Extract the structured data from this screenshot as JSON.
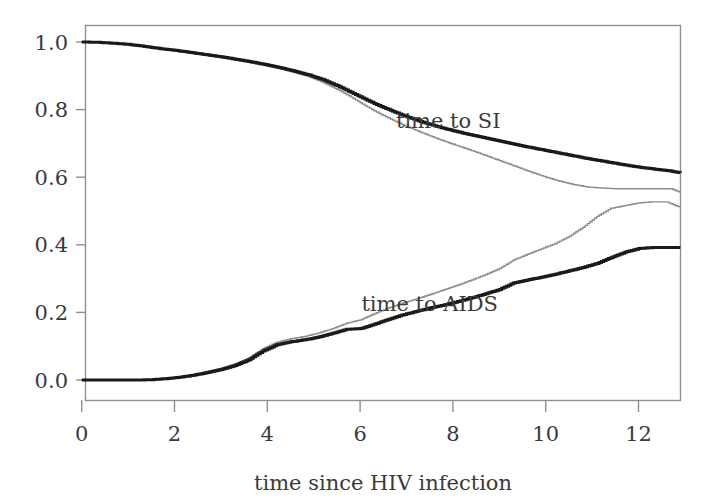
{
  "chart_data": {
    "type": "line",
    "title": "",
    "subtitle": "",
    "xlabel": "time since HIV infection",
    "ylabel": "",
    "xlim": [
      -0.1,
      12.92
    ],
    "ylim": [
      -0.02,
      1.055
    ],
    "grid": false,
    "legend_position": "inline-annotations",
    "x_ticks": [
      0,
      2,
      4,
      6,
      8,
      10,
      12
    ],
    "x_tick_labels": [
      "0",
      "2",
      "4",
      "6",
      "8",
      "10",
      "12"
    ],
    "y_ticks": [
      0.0,
      0.2,
      0.4,
      0.6,
      0.8,
      1.0
    ],
    "y_tick_labels": [
      "0.0",
      "0.2",
      "0.4",
      "0.6",
      "0.8",
      "1.0"
    ],
    "annotations": [
      {
        "text": "time to SI",
        "x": 7.9,
        "y": 0.745
      },
      {
        "text": "time to AIDS",
        "x": 7.5,
        "y": 0.205
      }
    ],
    "series": [
      {
        "name": "time to SI (bold)",
        "style": "step",
        "color": "#1a1a1a",
        "width": 3.0,
        "points": [
          [
            0.0,
            1.0
          ],
          [
            0.35,
            0.999
          ],
          [
            0.7,
            0.996
          ],
          [
            1.0,
            0.993
          ],
          [
            1.3,
            0.988
          ],
          [
            1.6,
            0.982
          ],
          [
            1.9,
            0.977
          ],
          [
            2.2,
            0.972
          ],
          [
            2.5,
            0.966
          ],
          [
            2.8,
            0.96
          ],
          [
            3.1,
            0.954
          ],
          [
            3.4,
            0.947
          ],
          [
            3.7,
            0.94
          ],
          [
            4.0,
            0.932
          ],
          [
            4.3,
            0.923
          ],
          [
            4.6,
            0.913
          ],
          [
            4.9,
            0.902
          ],
          [
            5.2,
            0.888
          ],
          [
            5.5,
            0.871
          ],
          [
            5.8,
            0.851
          ],
          [
            6.1,
            0.831
          ],
          [
            6.4,
            0.812
          ],
          [
            6.7,
            0.795
          ],
          [
            7.0,
            0.779
          ],
          [
            7.3,
            0.765
          ],
          [
            7.6,
            0.752
          ],
          [
            7.9,
            0.741
          ],
          [
            8.2,
            0.731
          ],
          [
            8.5,
            0.722
          ],
          [
            8.8,
            0.713
          ],
          [
            9.1,
            0.704
          ],
          [
            9.4,
            0.695
          ],
          [
            9.7,
            0.687
          ],
          [
            10.0,
            0.679
          ],
          [
            10.3,
            0.671
          ],
          [
            10.6,
            0.663
          ],
          [
            10.9,
            0.655
          ],
          [
            11.2,
            0.648
          ],
          [
            11.5,
            0.641
          ],
          [
            11.8,
            0.634
          ],
          [
            12.1,
            0.628
          ],
          [
            12.4,
            0.623
          ],
          [
            12.7,
            0.618
          ],
          [
            12.9,
            0.613
          ]
        ]
      },
      {
        "name": "time to SI (thin)",
        "style": "step",
        "color": "#8c8c8c",
        "width": 1.4,
        "points": [
          [
            0.0,
            1.0
          ],
          [
            0.35,
            0.999
          ],
          [
            0.7,
            0.996
          ],
          [
            1.0,
            0.992
          ],
          [
            1.3,
            0.987
          ],
          [
            1.6,
            0.981
          ],
          [
            1.9,
            0.976
          ],
          [
            2.2,
            0.97
          ],
          [
            2.5,
            0.964
          ],
          [
            2.8,
            0.958
          ],
          [
            3.1,
            0.952
          ],
          [
            3.4,
            0.945
          ],
          [
            3.7,
            0.937
          ],
          [
            4.0,
            0.929
          ],
          [
            4.3,
            0.92
          ],
          [
            4.6,
            0.909
          ],
          [
            4.9,
            0.897
          ],
          [
            5.2,
            0.88
          ],
          [
            5.5,
            0.86
          ],
          [
            5.8,
            0.837
          ],
          [
            6.1,
            0.812
          ],
          [
            6.4,
            0.789
          ],
          [
            6.7,
            0.769
          ],
          [
            7.0,
            0.75
          ],
          [
            7.3,
            0.733
          ],
          [
            7.6,
            0.717
          ],
          [
            7.9,
            0.702
          ],
          [
            8.2,
            0.688
          ],
          [
            8.5,
            0.674
          ],
          [
            8.8,
            0.659
          ],
          [
            9.1,
            0.644
          ],
          [
            9.4,
            0.629
          ],
          [
            9.7,
            0.614
          ],
          [
            10.0,
            0.6
          ],
          [
            10.3,
            0.588
          ],
          [
            10.6,
            0.578
          ],
          [
            10.9,
            0.571
          ],
          [
            11.2,
            0.568
          ],
          [
            11.5,
            0.566
          ],
          [
            11.8,
            0.566
          ],
          [
            12.1,
            0.566
          ],
          [
            12.4,
            0.566
          ],
          [
            12.7,
            0.566
          ],
          [
            12.9,
            0.555
          ]
        ]
      },
      {
        "name": "time to AIDS (bold)",
        "style": "step",
        "color": "#1a1a1a",
        "width": 3.0,
        "points": [
          [
            0.0,
            0.0
          ],
          [
            0.4,
            0.0
          ],
          [
            0.8,
            0.0
          ],
          [
            1.2,
            0.0
          ],
          [
            1.5,
            0.001
          ],
          [
            1.8,
            0.004
          ],
          [
            2.1,
            0.008
          ],
          [
            2.4,
            0.014
          ],
          [
            2.7,
            0.022
          ],
          [
            3.0,
            0.031
          ],
          [
            3.3,
            0.043
          ],
          [
            3.6,
            0.06
          ],
          [
            3.9,
            0.086
          ],
          [
            4.2,
            0.104
          ],
          [
            4.5,
            0.113
          ],
          [
            4.8,
            0.119
          ],
          [
            5.1,
            0.127
          ],
          [
            5.4,
            0.138
          ],
          [
            5.7,
            0.15
          ],
          [
            6.0,
            0.152
          ],
          [
            6.3,
            0.165
          ],
          [
            6.6,
            0.179
          ],
          [
            6.9,
            0.192
          ],
          [
            7.2,
            0.203
          ],
          [
            7.5,
            0.213
          ],
          [
            7.8,
            0.222
          ],
          [
            8.1,
            0.232
          ],
          [
            8.4,
            0.243
          ],
          [
            8.7,
            0.255
          ],
          [
            9.0,
            0.268
          ],
          [
            9.3,
            0.287
          ],
          [
            9.6,
            0.296
          ],
          [
            9.9,
            0.304
          ],
          [
            10.2,
            0.313
          ],
          [
            10.5,
            0.323
          ],
          [
            10.8,
            0.333
          ],
          [
            11.1,
            0.345
          ],
          [
            11.4,
            0.362
          ],
          [
            11.7,
            0.378
          ],
          [
            12.0,
            0.389
          ],
          [
            12.3,
            0.392
          ],
          [
            12.6,
            0.392
          ],
          [
            12.9,
            0.392
          ]
        ]
      },
      {
        "name": "time to AIDS (thin)",
        "style": "step",
        "color": "#8c8c8c",
        "width": 1.4,
        "points": [
          [
            0.0,
            0.0
          ],
          [
            0.4,
            0.0
          ],
          [
            0.8,
            0.0
          ],
          [
            1.2,
            0.0
          ],
          [
            1.5,
            0.001
          ],
          [
            1.8,
            0.005
          ],
          [
            2.1,
            0.009
          ],
          [
            2.4,
            0.016
          ],
          [
            2.7,
            0.025
          ],
          [
            3.0,
            0.035
          ],
          [
            3.3,
            0.048
          ],
          [
            3.6,
            0.066
          ],
          [
            3.9,
            0.093
          ],
          [
            4.2,
            0.112
          ],
          [
            4.5,
            0.122
          ],
          [
            4.8,
            0.129
          ],
          [
            5.1,
            0.139
          ],
          [
            5.4,
            0.152
          ],
          [
            5.7,
            0.168
          ],
          [
            6.0,
            0.178
          ],
          [
            6.3,
            0.196
          ],
          [
            6.6,
            0.213
          ],
          [
            6.9,
            0.227
          ],
          [
            7.2,
            0.24
          ],
          [
            7.5,
            0.253
          ],
          [
            7.8,
            0.267
          ],
          [
            8.1,
            0.281
          ],
          [
            8.4,
            0.296
          ],
          [
            8.7,
            0.312
          ],
          [
            9.0,
            0.33
          ],
          [
            9.3,
            0.355
          ],
          [
            9.6,
            0.372
          ],
          [
            9.9,
            0.388
          ],
          [
            10.2,
            0.404
          ],
          [
            10.5,
            0.425
          ],
          [
            10.8,
            0.452
          ],
          [
            11.1,
            0.484
          ],
          [
            11.4,
            0.508
          ],
          [
            11.7,
            0.516
          ],
          [
            12.0,
            0.524
          ],
          [
            12.3,
            0.527
          ],
          [
            12.6,
            0.527
          ],
          [
            12.9,
            0.51
          ]
        ]
      }
    ]
  },
  "axes": {
    "x_title": "time since HIV infection",
    "x_tick_labels": [
      "0",
      "2",
      "4",
      "6",
      "8",
      "10",
      "12"
    ],
    "y_tick_labels": [
      "0.0",
      "0.2",
      "0.4",
      "0.6",
      "0.8",
      "1.0"
    ]
  },
  "labels": {
    "si": "time to SI",
    "aids": "time to AIDS"
  },
  "colors": {
    "bold_curve": "#1a1a1a",
    "thin_curve": "#8c8c8c",
    "frame": "#909090",
    "text": "#3a3a3a",
    "background": "#ffffff"
  }
}
